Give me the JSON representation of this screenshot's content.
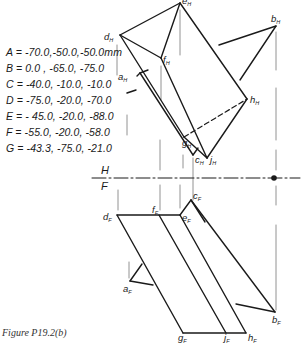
{
  "points": [
    {
      "name": "A",
      "coords": "-70.0,-50.0,-50.0mm"
    },
    {
      "name": "B",
      "coords": "0.0 , -65.0, -75.0"
    },
    {
      "name": "C",
      "coords": "-40.0, -10.0, -10.0"
    },
    {
      "name": "D",
      "coords": "-75.0, -20.0, -70.0"
    },
    {
      "name": "E",
      "coords": "- 45.0, -20.0, -88.0"
    },
    {
      "name": "F",
      "coords": "-55.0, -20.0, -58.0"
    },
    {
      "name": "G",
      "coords": "-43.3, -75.0, -21.0"
    }
  ],
  "coord_lines": [
    "A = -70.0,-50.0,-50.0mm",
    "B = 0.0 , -65.0, -75.0",
    "C = -40.0, -10.0, -10.0",
    "D = -75.0, -20.0, -70.0",
    "E = - 45.0, -20.0, -88.0",
    "F = -55.0, -20.0, -58.0",
    "G = -43.3, -75.0, -21.0"
  ],
  "fold_line": {
    "top": "H",
    "bottom": "F"
  },
  "top_view_labels": {
    "e": "e",
    "d": "d",
    "f": "f",
    "b": "b",
    "a": "a",
    "h": "h",
    "g": "g",
    "c": "c",
    "j": "j",
    "subscript": "H"
  },
  "front_view_labels": {
    "c": "c",
    "d": "d",
    "f": "f",
    "e": "e",
    "a": "a",
    "b": "b",
    "g": "g",
    "j": "j",
    "h": "h",
    "subscript": "F"
  },
  "caption": "Figure P19.2(b)"
}
